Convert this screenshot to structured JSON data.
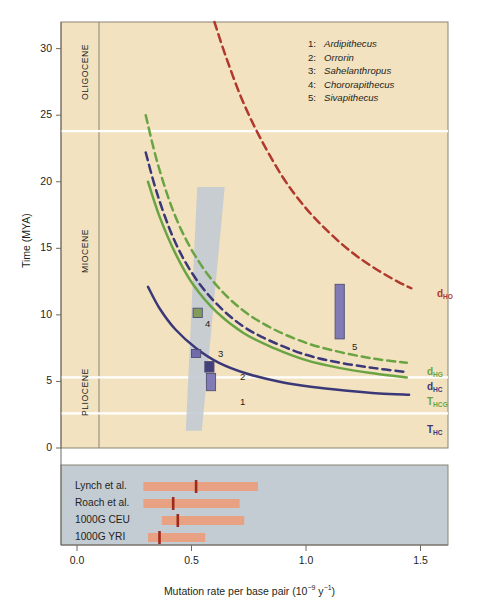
{
  "figure": {
    "plot_bg": "#f2e2c0",
    "band_bg": "#c3cbd3",
    "panel_border": "#8a8276"
  },
  "axes": {
    "y": {
      "label": "Time (MYA)",
      "ticks": [
        0,
        5,
        10,
        15,
        20,
        25,
        30
      ],
      "tick_labels": [
        "0",
        "5",
        "10",
        "15",
        "20",
        "25",
        "30"
      ],
      "min": 0,
      "max": 32
    },
    "x": {
      "label_pre": "Mutation rate per base pair (10",
      "label_sup": "−9",
      "label_mid": " y",
      "label_sup2": "−1",
      "label_post": ")",
      "label_full": "Mutation rate per base pair (10−9 y−1)",
      "ticks": [
        0.0,
        0.5,
        1.0,
        1.5
      ],
      "tick_labels": [
        "0.0",
        "0.5",
        "1.0",
        "1.5"
      ],
      "min": -0.07,
      "max": 1.62
    }
  },
  "epochs": [
    {
      "name": "OLIGOCENE",
      "from": 23.8,
      "to": 32.0
    },
    {
      "name": "MIOCENE",
      "from": 5.3,
      "to": 23.8
    },
    {
      "name": "PLIOCENE",
      "from": 2.6,
      "to": 5.3
    }
  ],
  "legend": {
    "items": [
      {
        "num": "1:",
        "species": "Ardipithecus"
      },
      {
        "num": "2:",
        "species": "Orrorin"
      },
      {
        "num": "3:",
        "species": "Sahelanthropus"
      },
      {
        "num": "4:",
        "species": "Chororapithecus"
      },
      {
        "num": "5:",
        "species": "Sivapithecus"
      }
    ]
  },
  "curve_labels": [
    {
      "base": "d",
      "sub": "HO",
      "color": "#b0382c"
    },
    {
      "base": "d",
      "sub": "HG",
      "color": "#6aa442"
    },
    {
      "base": "d",
      "sub": "HC",
      "color": "#3b3878"
    },
    {
      "base": "T",
      "sub": "HCG",
      "color": "#6aa442"
    },
    {
      "base": "T",
      "sub": "HC",
      "color": "#3b3878"
    }
  ],
  "fossil_markers": [
    {
      "label": "1",
      "color": "#7b76b5"
    },
    {
      "label": "2",
      "color": "#3b3878"
    },
    {
      "label": "3",
      "color": "#6b67a8"
    },
    {
      "label": "4",
      "color": "#7f9a53"
    },
    {
      "label": "5",
      "color": "#7b76b5"
    }
  ],
  "studies": [
    {
      "name": "Lynch et al.",
      "low": 0.29,
      "high": 0.79,
      "estimate": 0.52
    },
    {
      "name": "Roach et al.",
      "low": 0.29,
      "high": 0.71,
      "estimate": 0.42
    },
    {
      "name": "1000G CEU",
      "low": 0.37,
      "high": 0.73,
      "estimate": 0.44
    },
    {
      "name": "1000G YRI",
      "low": 0.31,
      "high": 0.56,
      "estimate": 0.36
    }
  ],
  "chart_data": {
    "type": "line",
    "title": "",
    "xlabel": "Mutation rate per base pair (10−9 y−1)",
    "ylabel": "Time (MYA)",
    "xlim": [
      -0.07,
      1.62
    ],
    "ylim": [
      0,
      32
    ],
    "grid": false,
    "legend_position": "right-inline",
    "series": [
      {
        "name": "d_HO",
        "style": "dashed",
        "color": "#b0382c",
        "x": [
          0.6,
          0.65,
          0.72,
          0.8,
          0.9,
          1.0,
          1.1,
          1.2,
          1.3,
          1.4,
          1.46
        ],
        "y": [
          32.0,
          29.4,
          26.2,
          23.3,
          20.3,
          18.0,
          16.2,
          14.7,
          13.5,
          12.5,
          12.0
        ]
      },
      {
        "name": "d_HG",
        "style": "dashed",
        "color": "#6aa442",
        "x": [
          0.3,
          0.35,
          0.42,
          0.5,
          0.6,
          0.72,
          0.85,
          1.0,
          1.15,
          1.3,
          1.44
        ],
        "y": [
          25.0,
          21.5,
          17.8,
          14.9,
          12.4,
          10.4,
          9.0,
          7.9,
          7.2,
          6.7,
          6.4
        ]
      },
      {
        "name": "d_HC",
        "style": "dashed",
        "color": "#3b3878",
        "x": [
          0.3,
          0.35,
          0.42,
          0.5,
          0.6,
          0.72,
          0.85,
          1.0,
          1.15,
          1.3,
          1.44
        ],
        "y": [
          22.2,
          19.1,
          15.8,
          13.2,
          11.0,
          9.2,
          8.0,
          7.0,
          6.4,
          6.0,
          5.7
        ]
      },
      {
        "name": "T_HCG",
        "style": "solid",
        "color": "#6aa442",
        "x": [
          0.31,
          0.36,
          0.43,
          0.51,
          0.61,
          0.73,
          0.86,
          1.0,
          1.15,
          1.3,
          1.44
        ],
        "y": [
          20.0,
          17.4,
          14.6,
          12.2,
          10.2,
          8.6,
          7.5,
          6.6,
          6.0,
          5.6,
          5.3
        ]
      },
      {
        "name": "T_HC",
        "style": "solid",
        "color": "#3b3878",
        "x": [
          0.31,
          0.36,
          0.43,
          0.52,
          0.62,
          0.74,
          0.88,
          1.02,
          1.18,
          1.32,
          1.45
        ],
        "y": [
          12.1,
          10.5,
          8.9,
          7.5,
          6.4,
          5.6,
          5.0,
          4.6,
          4.3,
          4.1,
          4.0
        ]
      }
    ],
    "uncertainty_band": {
      "name": "human-chimp split range",
      "color": "#c3cbd3",
      "top_y": 19.6,
      "bottom_y": 1.3,
      "top_x_range": [
        0.525,
        0.645
      ],
      "bottom_x_range": [
        0.475,
        0.545
      ]
    },
    "fossil_points": [
      {
        "label": "1",
        "species": "Ardipithecus",
        "x": 0.585,
        "y_low": 4.3,
        "y_high": 5.6
      },
      {
        "label": "2",
        "species": "Orrorin",
        "x": 0.578,
        "y_low": 5.7,
        "y_high": 6.5
      },
      {
        "label": "3",
        "species": "Sahelanthropus",
        "x": 0.52,
        "y_low": 6.8,
        "y_high": 7.4
      },
      {
        "label": "4",
        "species": "Chororapithecus",
        "x": 0.527,
        "y_low": 9.8,
        "y_high": 10.5
      },
      {
        "label": "5",
        "species": "Sivapithecus",
        "x": 1.147,
        "y_low": 8.2,
        "y_high": 12.3
      }
    ],
    "study_intervals": [
      {
        "name": "Lynch et al.",
        "low": 0.29,
        "high": 0.79,
        "estimate": 0.52
      },
      {
        "name": "Roach et al.",
        "low": 0.29,
        "high": 0.71,
        "estimate": 0.42
      },
      {
        "name": "1000G CEU",
        "low": 0.37,
        "high": 0.73,
        "estimate": 0.44
      },
      {
        "name": "1000G YRI",
        "low": 0.31,
        "high": 0.56,
        "estimate": 0.36
      }
    ]
  }
}
